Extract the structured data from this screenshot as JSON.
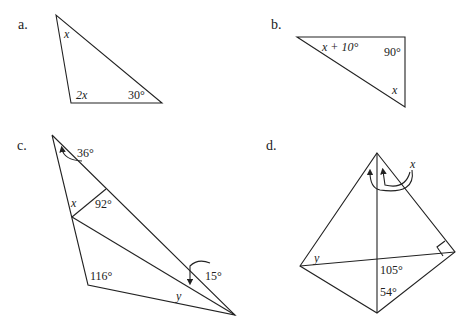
{
  "figures": [
    {
      "id": "a",
      "label": "a.",
      "shape": "triangle",
      "angles": {
        "top": "x",
        "bottom_left": "2x",
        "bottom_right": "30°"
      }
    },
    {
      "id": "b",
      "label": "b.",
      "shape": "right-triangle",
      "angles": {
        "left": "x + 10°",
        "top_right": "90°",
        "bottom_right": "x"
      }
    },
    {
      "id": "c",
      "label": "c.",
      "shape": "quadrilateral-with-segments",
      "angles": {
        "top_exterior": "36°",
        "inner": "92°",
        "left": "x",
        "bottom_left": "116°",
        "right_exterior": "15°",
        "bottom": "y"
      }
    },
    {
      "id": "d",
      "label": "d.",
      "shape": "kite-with-diagonals",
      "angles": {
        "top": "x",
        "left": "y",
        "center": "105°",
        "bottom": "54°",
        "right": "right-angle"
      }
    }
  ]
}
